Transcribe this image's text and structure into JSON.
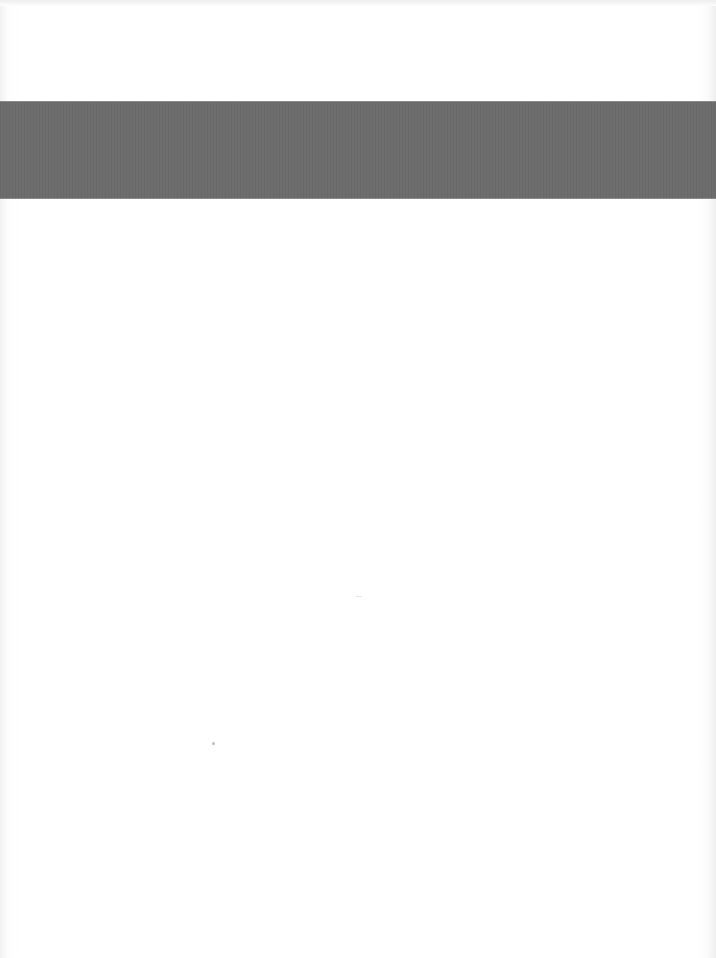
{
  "document": {
    "type": "scanned-page",
    "banner": {
      "color": "#6b6b6b",
      "text": ""
    },
    "body_text": "",
    "background_color": "#ffffff"
  }
}
